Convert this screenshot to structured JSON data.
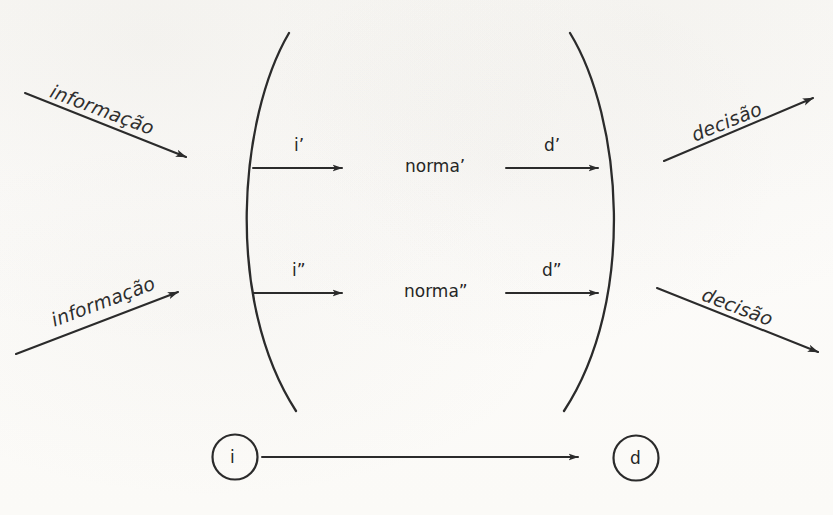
{
  "figure": {
    "background_color": "#fbfaf8",
    "ink_color": "#2b2b2b"
  },
  "outer_flows": {
    "input_top": {
      "label": "informação",
      "direction": "down-right"
    },
    "input_bottom": {
      "label": "informação",
      "direction": "up-right"
    },
    "output_top": {
      "label": "decisão",
      "direction": "up-right"
    },
    "output_bottom": {
      "label": "decisão",
      "direction": "down-right"
    }
  },
  "brackets": {
    "left": {
      "name": "left-paren",
      "glyph": "("
    },
    "right": {
      "name": "right-paren",
      "glyph": ")"
    }
  },
  "rows": [
    {
      "input_label": "i’",
      "norma_label": "norma’",
      "output_label": "d’"
    },
    {
      "input_label": "i”",
      "norma_label": "norma”",
      "output_label": "d”"
    }
  ],
  "bottom_row": {
    "source_node": "i",
    "target_node": "d"
  }
}
